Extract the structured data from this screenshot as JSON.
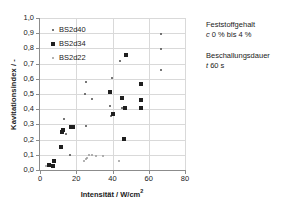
{
  "chart_data": {
    "type": "scatter",
    "title": "",
    "xlabel": "Intensität / W/cm²",
    "ylabel": "Kavitationsindex / -",
    "xlim": [
      0,
      80
    ],
    "ylim": [
      0.0,
      1.0
    ],
    "xticks": [
      "0",
      "20",
      "40",
      "60",
      "80"
    ],
    "xtick_values": [
      0,
      20,
      40,
      60,
      80
    ],
    "yticks": [
      "0,0",
      "0,1",
      "0,2",
      "0,3",
      "0,4",
      "0,5",
      "0,6",
      "0,7",
      "0,8",
      "0,9",
      "1,0"
    ],
    "ytick_values": [
      0.0,
      0.1,
      0.2,
      0.3,
      0.4,
      0.5,
      0.6,
      0.7,
      0.8,
      0.9,
      1.0
    ],
    "grid": true,
    "legend_position": "top-left-inside",
    "series": [
      {
        "name": "BS2d40",
        "marker": "small-dot",
        "color": "#4a4a4a",
        "points": [
          [
            25.2,
            0.582
          ],
          [
            25.0,
            0.497
          ],
          [
            28.5,
            0.47
          ],
          [
            38.5,
            0.418
          ],
          [
            39.5,
            0.605
          ],
          [
            39.0,
            0.357
          ],
          [
            44.0,
            0.72
          ],
          [
            66.5,
            0.893
          ],
          [
            66.5,
            0.797
          ],
          [
            67.0,
            0.66
          ],
          [
            13.5,
            0.333
          ],
          [
            14.5,
            0.24
          ],
          [
            25.5,
            0.29
          ],
          [
            16.5,
            0.1
          ],
          [
            45.5,
            0.408
          ]
        ]
      },
      {
        "name": "BS2d34",
        "marker": "filled-square",
        "color": "#1f1f1f",
        "points": [
          [
            7.5,
            0.058
          ],
          [
            7.0,
            0.025
          ],
          [
            11.5,
            0.15
          ],
          [
            12.5,
            0.262
          ],
          [
            12.2,
            0.252
          ],
          [
            17.0,
            0.285
          ],
          [
            18.0,
            0.283
          ],
          [
            38.5,
            0.513
          ],
          [
            40.0,
            0.37
          ],
          [
            45.5,
            0.475
          ],
          [
            47.5,
            0.755
          ],
          [
            47.0,
            0.41
          ],
          [
            46.5,
            0.207
          ],
          [
            55.5,
            0.565
          ],
          [
            55.5,
            0.463
          ],
          [
            55.5,
            0.408
          ],
          [
            5.0,
            0.03
          ]
        ]
      },
      {
        "name": "BS2d22",
        "marker": "light-dot",
        "color": "#9a9a9a",
        "points": [
          [
            3.5,
            0.025
          ],
          [
            24.5,
            0.062
          ],
          [
            26.0,
            0.08
          ],
          [
            27.0,
            0.098
          ],
          [
            28.5,
            0.096
          ],
          [
            31.0,
            0.093
          ],
          [
            34.5,
            0.092
          ],
          [
            43.5,
            0.06
          ],
          [
            25.5,
            0.072
          ]
        ]
      }
    ]
  },
  "legend": {
    "items": [
      {
        "label": "BS2d40",
        "marker": "small-dot"
      },
      {
        "label": "BS2d34",
        "marker": "filled-square"
      },
      {
        "label": "BS2d22",
        "marker": "light-dot"
      }
    ]
  },
  "annotations": [
    {
      "title": "Feststoffgehalt",
      "symbol": "c",
      "value": "0 % bis  4 %"
    },
    {
      "title": "Beschallungsdauer",
      "symbol": "t",
      "value": "60 s"
    }
  ],
  "axis": {
    "x_title": "Intensität / W/cm",
    "x_title_sup": "2",
    "y_title": "Kavitationsindex / -"
  }
}
